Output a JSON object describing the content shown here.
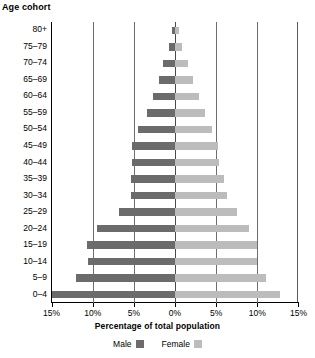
{
  "chart_data": {
    "type": "bar",
    "subtype": "population-pyramid",
    "title": "",
    "ylabel": "Age cohort",
    "xlabel": "Percentage of total population",
    "categories": [
      "80+",
      "75–79",
      "70–74",
      "65–69",
      "60–64",
      "55–59",
      "50–54",
      "45–49",
      "40–44",
      "35–39",
      "30–34",
      "25–29",
      "20–24",
      "15–19",
      "10–14",
      "5–9",
      "0–4"
    ],
    "series": [
      {
        "name": "Male",
        "side": "left",
        "color": "#6b6b6b",
        "values": [
          0.4,
          0.7,
          1.4,
          2.0,
          2.7,
          3.4,
          4.5,
          5.2,
          5.2,
          5.3,
          5.3,
          6.8,
          9.5,
          10.7,
          10.6,
          12.0,
          15.0
        ]
      },
      {
        "name": "Female",
        "side": "right",
        "color": "#bcbcbc",
        "values": [
          0.5,
          0.9,
          1.6,
          2.2,
          2.9,
          3.6,
          4.5,
          5.2,
          5.3,
          6.0,
          6.3,
          7.5,
          9.0,
          10.0,
          10.0,
          11.0,
          12.8
        ]
      }
    ],
    "xlim": [
      -15,
      15
    ],
    "xticks": [
      -15,
      -10,
      -5,
      0,
      5,
      10,
      15
    ],
    "xtick_labels": [
      "15%",
      "10%",
      "5%",
      "0%",
      "5%",
      "10%",
      "15%"
    ],
    "grid": true,
    "gridlines_at": [
      -10,
      -5,
      0,
      5,
      10
    ],
    "legend_position": "bottom-center",
    "legend": [
      {
        "label": "Male",
        "color": "#6b6b6b"
      },
      {
        "label": "Female",
        "color": "#bcbcbc"
      }
    ]
  },
  "colors": {
    "male": "#6b6b6b",
    "female": "#bcbcbc",
    "axis": "#000000",
    "grid": "#6e6e6e",
    "background": "#ffffff"
  }
}
